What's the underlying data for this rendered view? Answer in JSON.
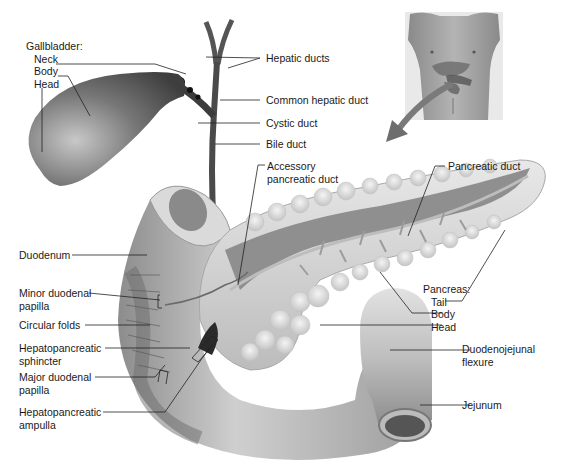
{
  "diagram": {
    "colors": {
      "background": "#ffffff",
      "organ_dark": "#5a5a5a",
      "organ_mid": "#9a9a9a",
      "organ_light": "#d4d4d4",
      "leader_line": "#222222",
      "arrow": "#7a7a7a",
      "text": "#1a1a1a"
    },
    "inset": {
      "name": "torso-location-inset",
      "description": "Male torso showing organ location"
    },
    "labels": {
      "gallbladder": {
        "heading": "Gallbladder:",
        "neck": "Neck",
        "body": "Body",
        "head": "Head"
      },
      "hepatic_ducts": "Hepatic ducts",
      "common_hepatic_duct": "Common hepatic duct",
      "cystic_duct": "Cystic duct",
      "bile_duct": "Bile duct",
      "accessory_pancreatic_duct": {
        "line1": "Accessory",
        "line2": "pancreatic duct"
      },
      "pancreatic_duct": "Pancreatic duct",
      "duodenum": "Duodenum",
      "minor_duodenal_papilla": {
        "line1": "Minor duodenal",
        "line2": "papilla"
      },
      "circular_folds": "Circular folds",
      "hepatopancreatic_sphincter": {
        "line1": "Hepatopancreatic",
        "line2": "sphincter"
      },
      "major_duodenal_papilla": {
        "line1": "Major duodenal",
        "line2": "papilla"
      },
      "hepatopancreatic_ampulla": {
        "line1": "Hepatopancreatic",
        "line2": "ampulla"
      },
      "pancreas": {
        "heading": "Pancreas:",
        "tail": "Tail",
        "body": "Body",
        "head": "Head"
      },
      "duodenojejunal_flexure": {
        "line1": "Duodenojejunal",
        "line2": "flexure"
      },
      "jejunum": "Jejunum"
    }
  }
}
